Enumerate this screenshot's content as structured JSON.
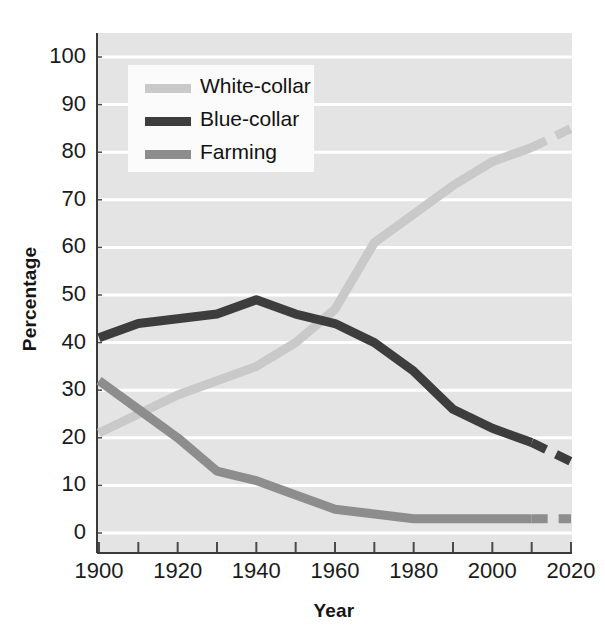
{
  "figure": {
    "background_color": "#ffffff",
    "plot_background_color": "#e4e4e4",
    "gridline_color": "#ffffff",
    "axis_color": "#3a3a3a"
  },
  "axes": {
    "y_title": "Percentage",
    "x_title": "Year",
    "y_ticks": [
      "0",
      "10",
      "20",
      "30",
      "40",
      "50",
      "60",
      "70",
      "80",
      "90",
      "100"
    ],
    "x_ticks": [
      "1900",
      "1920",
      "1940",
      "1960",
      "1980",
      "2000",
      "2020"
    ],
    "x_minor_ticks": [
      "1910",
      "1930",
      "1950",
      "1970",
      "1990",
      "2010"
    ]
  },
  "legend": {
    "position": "upper-left-inside",
    "entries": [
      {
        "label": "White-collar",
        "color": "#c9c9c9"
      },
      {
        "label": "Blue-collar",
        "color": "#3d3d3d"
      },
      {
        "label": "Farming",
        "color": "#8d8d8d"
      }
    ]
  },
  "chart_data": {
    "type": "line",
    "title": "",
    "xlabel": "Year",
    "ylabel": "Percentage",
    "xlim": [
      1900,
      2020
    ],
    "ylim": [
      0,
      100
    ],
    "xticks": [
      1900,
      1920,
      1940,
      1960,
      1980,
      2000,
      2020
    ],
    "yticks": [
      0,
      10,
      20,
      30,
      40,
      50,
      60,
      70,
      80,
      90,
      100
    ],
    "grid": "horizontal",
    "legend_position": "upper left",
    "x": [
      1900,
      1910,
      1920,
      1930,
      1940,
      1950,
      1960,
      1970,
      1980,
      1990,
      2000,
      2010,
      2020
    ],
    "series": [
      {
        "name": "White-collar",
        "color": "#c9c9c9",
        "values": [
          21,
          25,
          29,
          32,
          35,
          40,
          47,
          61,
          67,
          73,
          78,
          81,
          85
        ],
        "projected_from": 2010,
        "linestyle_projected": "dashed"
      },
      {
        "name": "Blue-collar",
        "color": "#3d3d3d",
        "values": [
          41,
          44,
          45,
          46,
          49,
          46,
          44,
          40,
          34,
          26,
          22,
          19,
          15
        ],
        "projected_from": 2010,
        "linestyle_projected": "dashed"
      },
      {
        "name": "Farming",
        "color": "#8d8d8d",
        "values": [
          32,
          26,
          20,
          13,
          11,
          8,
          5,
          4,
          3,
          3,
          3,
          3,
          3
        ],
        "projected_from": 2010,
        "linestyle_projected": "dashed"
      }
    ]
  }
}
